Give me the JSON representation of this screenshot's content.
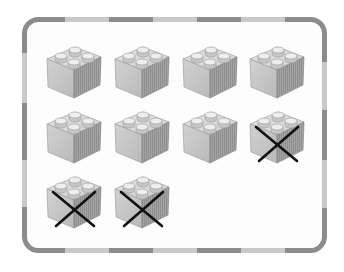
{
  "panel": {
    "border_dark": "#8c8c8c",
    "border_light": "#c9c9c9",
    "background": "#fdfdfd"
  },
  "blocks": {
    "total": 10,
    "crossed_out": 3,
    "remaining": 7,
    "items": [
      {
        "row": 1,
        "col": 1,
        "crossed": false
      },
      {
        "row": 1,
        "col": 2,
        "crossed": false
      },
      {
        "row": 1,
        "col": 3,
        "crossed": false
      },
      {
        "row": 1,
        "col": 4,
        "crossed": false
      },
      {
        "row": 2,
        "col": 1,
        "crossed": false
      },
      {
        "row": 2,
        "col": 2,
        "crossed": false
      },
      {
        "row": 2,
        "col": 3,
        "crossed": false
      },
      {
        "row": 2,
        "col": 4,
        "crossed": true
      },
      {
        "row": 3,
        "col": 1,
        "crossed": true
      },
      {
        "row": 3,
        "col": 2,
        "crossed": true
      }
    ]
  }
}
